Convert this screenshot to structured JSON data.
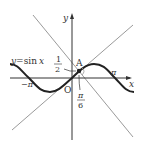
{
  "diagram": {
    "title": "",
    "curve_label": "y = sin x",
    "axes": {
      "x_label": "x",
      "y_label": "y",
      "origin_label": "O"
    },
    "point": {
      "name": "A",
      "x_label_num": "π",
      "x_label_den": "6",
      "y_label_num": "1",
      "y_label_den": "2"
    },
    "ticks": {
      "pi": "π",
      "neg_pi": "−π"
    },
    "colors": {
      "curve": "#222222",
      "axes": "#333333",
      "lines": "#9a9a9a"
    }
  },
  "labels": {
    "y_eq": "y",
    "eq": "=",
    "sin": "sin",
    "x_var": "x"
  }
}
